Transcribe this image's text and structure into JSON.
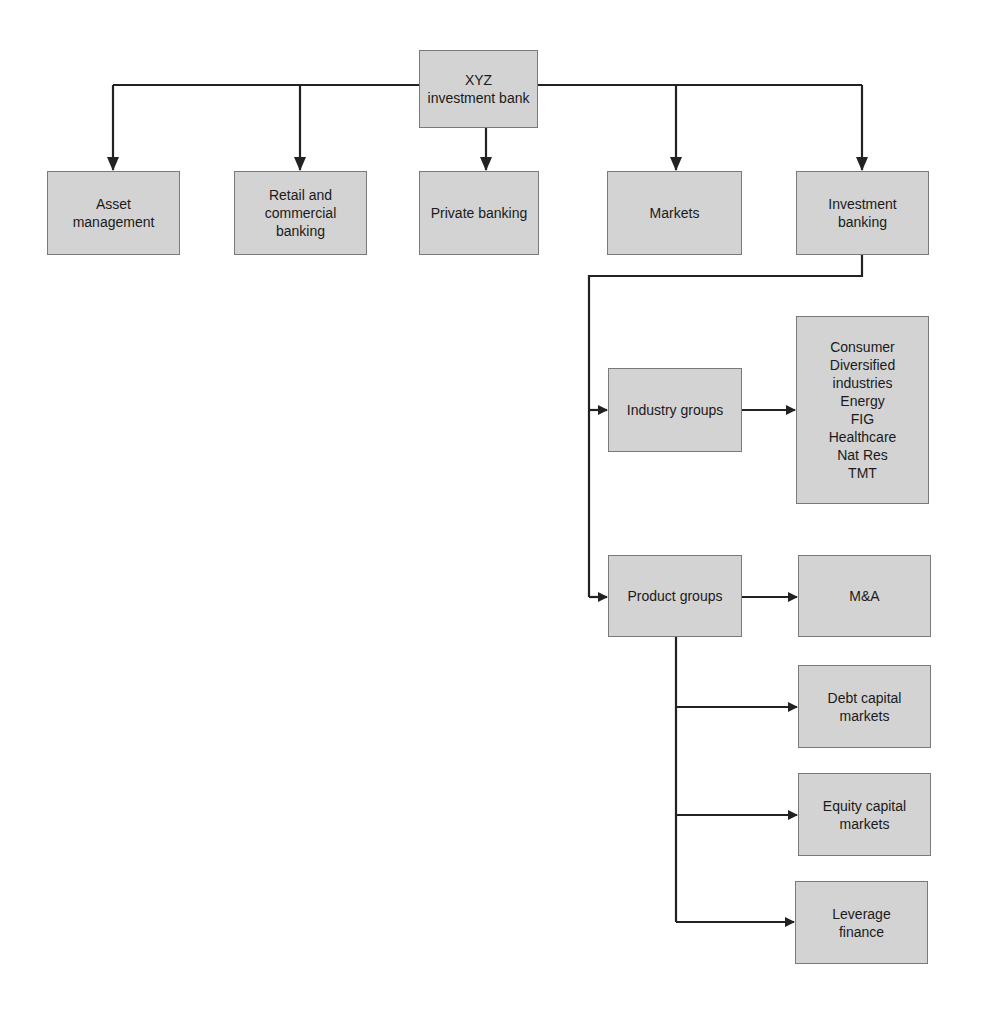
{
  "diagram": {
    "type": "org-chart",
    "root": {
      "label": "XYZ\ninvestment bank"
    },
    "divisions": [
      {
        "label": "Asset\nmanagement"
      },
      {
        "label": "Retail and\ncommercial\nbanking"
      },
      {
        "label": "Private banking"
      },
      {
        "label": "Markets"
      },
      {
        "label": "Investment\nbanking"
      }
    ],
    "investment_banking": {
      "industry_groups": {
        "label": "Industry groups",
        "sectors_label": "Consumer\nDiversified\nindustries\nEnergy\nFIG\nHealthcare\nNat Res\nTMT",
        "sectors": [
          "Consumer",
          "Diversified industries",
          "Energy",
          "FIG",
          "Healthcare",
          "Nat Res",
          "TMT"
        ]
      },
      "product_groups": {
        "label": "Product groups",
        "products": [
          {
            "label": "M&A"
          },
          {
            "label": "Debt capital\nmarkets"
          },
          {
            "label": "Equity capital\nmarkets"
          },
          {
            "label": "Leverage\nfinance"
          }
        ]
      }
    },
    "colors": {
      "box_fill": "#d3d3d3",
      "box_border": "#7a7a7a",
      "line": "#222222"
    }
  }
}
